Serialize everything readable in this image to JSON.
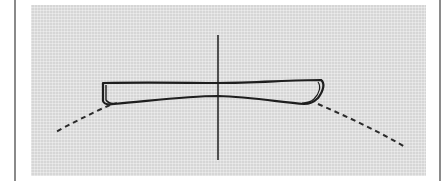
{
  "figure": {
    "colors": {
      "background": "#ffffff",
      "panel": "#d6d6d6",
      "stroke": "#1e1e1e",
      "border": "#8a8a8a"
    },
    "elements": [
      {
        "id": "center-axis",
        "type": "solid-line"
      },
      {
        "id": "profile-outline",
        "type": "closed-curve"
      },
      {
        "id": "left-extension",
        "type": "dashed-line"
      },
      {
        "id": "right-extension",
        "type": "dashed-line"
      }
    ]
  }
}
